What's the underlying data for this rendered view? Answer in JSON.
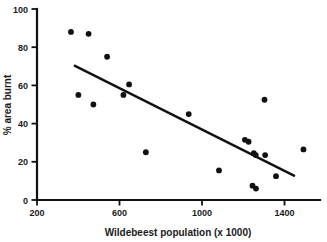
{
  "chart_data": {
    "type": "scatter",
    "title": "",
    "xlabel": "Wildebeest population (x 1000)",
    "ylabel": "% area burnt",
    "xlim": [
      200,
      1500
    ],
    "ylim": [
      0,
      100
    ],
    "xticks": [
      200,
      600,
      1000,
      1400
    ],
    "yticks": [
      0,
      20,
      40,
      60,
      80,
      100
    ],
    "xtick_labels": [
      "200",
      "600",
      "1000",
      "1400"
    ],
    "ytick_labels": [
      "0",
      "20",
      "40",
      "60",
      "80",
      "100"
    ],
    "grid": false,
    "legend": false,
    "marker": "filled-circle",
    "marker_color": "#111111",
    "points": [
      {
        "x": 356,
        "y": 88
      },
      {
        "x": 437,
        "y": 87
      },
      {
        "x": 522,
        "y": 75
      },
      {
        "x": 390,
        "y": 55
      },
      {
        "x": 459,
        "y": 50
      },
      {
        "x": 597,
        "y": 55
      },
      {
        "x": 623,
        "y": 60.5
      },
      {
        "x": 700,
        "y": 25
      },
      {
        "x": 897,
        "y": 45
      },
      {
        "x": 1036,
        "y": 15.5
      },
      {
        "x": 1155,
        "y": 31.5
      },
      {
        "x": 1172,
        "y": 30.5
      },
      {
        "x": 1196,
        "y": 24.5
      },
      {
        "x": 1205,
        "y": 23.5
      },
      {
        "x": 1190,
        "y": 7.5
      },
      {
        "x": 1206,
        "y": 6
      },
      {
        "x": 1245,
        "y": 52.5
      },
      {
        "x": 1248,
        "y": 23.5
      },
      {
        "x": 1298,
        "y": 12.5
      },
      {
        "x": 1424,
        "y": 26.5
      }
    ],
    "trend_line": {
      "name": "linear-fit",
      "x_start": 370,
      "y_start": 70.5,
      "x_end": 1385,
      "y_end": 12.5,
      "color": "#111111"
    },
    "axes": {
      "x_axis_color": "#111111",
      "y_axis_color": "#111111"
    }
  }
}
